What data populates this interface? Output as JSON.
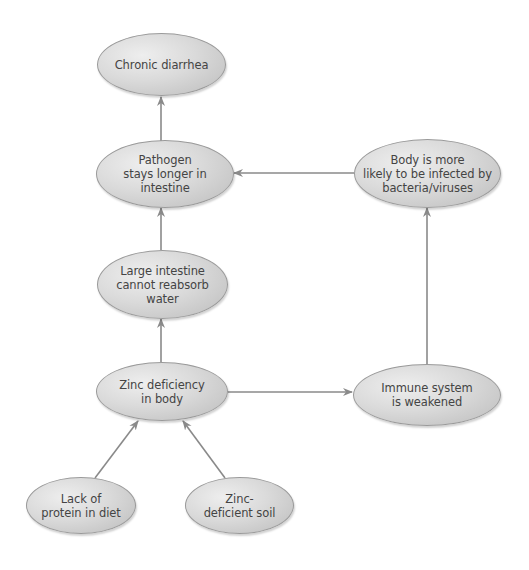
{
  "diagram": {
    "type": "flowchart",
    "nodes": [
      {
        "id": "chronic-diarrhea",
        "label": "Chronic diarrhea"
      },
      {
        "id": "pathogen",
        "label": "Pathogen\nstays longer in\nintestine"
      },
      {
        "id": "body-infected",
        "label": "Body is more\nlikely to be infected by\nbacteria/viruses"
      },
      {
        "id": "large-intestine",
        "label": "Large intestine\ncannot reabsorb\nwater"
      },
      {
        "id": "zinc-deficiency",
        "label": "Zinc deficiency\nin body"
      },
      {
        "id": "immune-system",
        "label": "Immune system\nis weakened"
      },
      {
        "id": "lack-protein",
        "label": "Lack of\nprotein in diet"
      },
      {
        "id": "zinc-soil",
        "label": "Zinc-\ndeficient soil"
      }
    ],
    "edges": [
      {
        "from": "pathogen",
        "to": "chronic-diarrhea"
      },
      {
        "from": "large-intestine",
        "to": "pathogen"
      },
      {
        "from": "zinc-deficiency",
        "to": "large-intestine"
      },
      {
        "from": "body-infected",
        "to": "pathogen"
      },
      {
        "from": "immune-system",
        "to": "body-infected"
      },
      {
        "from": "zinc-deficiency",
        "to": "immune-system"
      },
      {
        "from": "lack-protein",
        "to": "zinc-deficiency"
      },
      {
        "from": "zinc-soil",
        "to": "zinc-deficiency"
      }
    ],
    "colors": {
      "node_fill": "#d6d6d6",
      "node_border": "#9a9a9a",
      "arrow": "#8a8a8a",
      "text": "#444444"
    }
  }
}
